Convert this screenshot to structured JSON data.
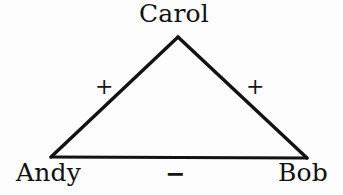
{
  "figure": {
    "kind": "signed-triad-graph",
    "background_color": "#fdfdfd",
    "stroke_color": "#131313",
    "text_color": "#111111"
  },
  "nodes": [
    {
      "id": "carol",
      "label": "Carol",
      "x": 178,
      "y": 37
    },
    {
      "id": "andy",
      "label": "Andy",
      "x": 51,
      "y": 157
    },
    {
      "id": "bob",
      "label": "Bob",
      "x": 307,
      "y": 158
    }
  ],
  "edges": [
    {
      "id": "andy-carol",
      "from": "Andy",
      "to": "Carol",
      "sign": "+"
    },
    {
      "id": "carol-bob",
      "from": "Carol",
      "to": "Bob",
      "sign": "+"
    },
    {
      "id": "andy-bob",
      "from": "Andy",
      "to": "Bob",
      "sign": "−"
    }
  ],
  "labels": {
    "carol": "Carol",
    "andy": "Andy",
    "bob": "Bob"
  },
  "signs": {
    "andy_carol": "+",
    "carol_bob": "+",
    "andy_bob": "−"
  }
}
